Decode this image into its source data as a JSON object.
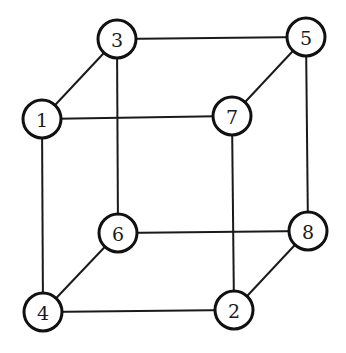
{
  "diagram": {
    "type": "cube-graph",
    "node_radius": 19,
    "nodes": [
      {
        "id": "1",
        "label": "1",
        "x": 42,
        "y": 119
      },
      {
        "id": "2",
        "label": "2",
        "x": 234,
        "y": 310
      },
      {
        "id": "3",
        "label": "3",
        "x": 117,
        "y": 39
      },
      {
        "id": "4",
        "label": "4",
        "x": 43,
        "y": 312
      },
      {
        "id": "5",
        "label": "5",
        "x": 306,
        "y": 37
      },
      {
        "id": "6",
        "label": "6",
        "x": 118,
        "y": 233
      },
      {
        "id": "7",
        "label": "7",
        "x": 232,
        "y": 116
      },
      {
        "id": "8",
        "label": "8",
        "x": 308,
        "y": 231
      }
    ],
    "edges": [
      [
        "3",
        "5"
      ],
      [
        "1",
        "7"
      ],
      [
        "1",
        "3"
      ],
      [
        "7",
        "5"
      ],
      [
        "1",
        "4"
      ],
      [
        "3",
        "6"
      ],
      [
        "7",
        "2"
      ],
      [
        "5",
        "8"
      ],
      [
        "6",
        "8"
      ],
      [
        "4",
        "2"
      ],
      [
        "4",
        "6"
      ],
      [
        "2",
        "8"
      ]
    ]
  }
}
